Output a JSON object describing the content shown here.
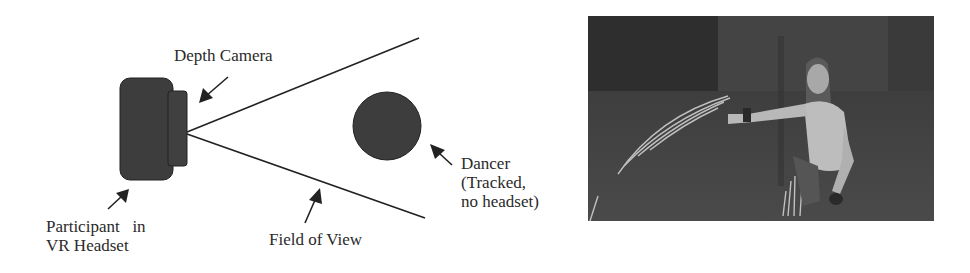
{
  "figure": {
    "diagram": {
      "labels": {
        "depth_camera": "Depth Camera",
        "participant": [
          "Participant   in",
          "VR Headset"
        ],
        "field_of_view": "Field of View",
        "dancer": [
          "Dancer",
          "(Tracked,",
          "no headset)"
        ]
      },
      "colors": {
        "shape_fill": "#3d3d3d",
        "line": "#222222",
        "text": "#2a2a2a"
      }
    },
    "photo": {
      "description": "Grayscale photo of a long-haired dancer crouching with outstretched arm leaving light trails",
      "colors": {
        "background": "#3a3a3a",
        "figure": "#bdbdbd",
        "trails": "#d8d8d8"
      }
    }
  }
}
